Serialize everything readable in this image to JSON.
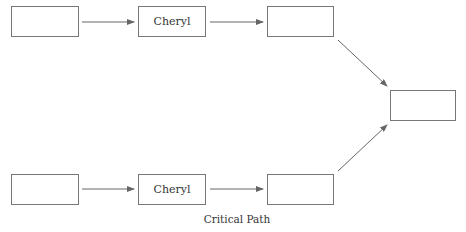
{
  "diagram": {
    "title": "Critical Path",
    "edge_color": "#666666",
    "border_color": "#777777",
    "nodes": [
      {
        "id": "top-1",
        "label": "",
        "x": 11,
        "y": 6,
        "w": 68,
        "h": 31
      },
      {
        "id": "top-2",
        "label": "Cheryl",
        "x": 138,
        "y": 6,
        "w": 68,
        "h": 31
      },
      {
        "id": "top-3",
        "label": "",
        "x": 267,
        "y": 6,
        "w": 67,
        "h": 31
      },
      {
        "id": "end",
        "label": "",
        "x": 390,
        "y": 90,
        "w": 66,
        "h": 31
      },
      {
        "id": "bottom-1",
        "label": "",
        "x": 11,
        "y": 174,
        "w": 68,
        "h": 31
      },
      {
        "id": "bottom-2",
        "label": "Cheryl",
        "x": 138,
        "y": 174,
        "w": 68,
        "h": 31
      },
      {
        "id": "bottom-3",
        "label": "",
        "x": 267,
        "y": 174,
        "w": 67,
        "h": 31
      }
    ],
    "edges": [
      {
        "from": "top-1",
        "to": "top-2"
      },
      {
        "from": "top-2",
        "to": "top-3"
      },
      {
        "from": "top-3",
        "to": "end"
      },
      {
        "from": "bottom-1",
        "to": "bottom-2"
      },
      {
        "from": "bottom-2",
        "to": "bottom-3"
      },
      {
        "from": "bottom-3",
        "to": "end"
      }
    ]
  }
}
